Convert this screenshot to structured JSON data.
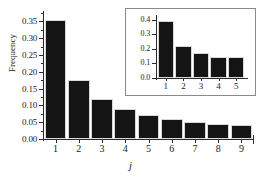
{
  "chart_data": [
    {
      "id": "main",
      "type": "bar",
      "title": "",
      "xlabel": "j",
      "ylabel": "Frequency",
      "categories": [
        "1",
        "2",
        "3",
        "4",
        "5",
        "6",
        "7",
        "8",
        "9"
      ],
      "values": [
        0.354,
        0.177,
        0.12,
        0.09,
        0.072,
        0.06,
        0.052,
        0.046,
        0.041
      ],
      "xlim": [
        0.5,
        9.5
      ],
      "ylim": [
        0.0,
        0.375
      ],
      "ytick_labels": [
        "0.00",
        "0.05",
        "0.10",
        "0.15",
        "0.20",
        "0.25",
        "0.30",
        "0.35"
      ],
      "ytick_values": [
        0.0,
        0.05,
        0.1,
        0.15,
        0.2,
        0.25,
        0.3,
        0.35
      ],
      "grid": false,
      "legend": "none",
      "bar_color": "#141414",
      "axis_color": "#2b2b2b"
    },
    {
      "id": "inset",
      "type": "bar",
      "title": "",
      "xlabel": "",
      "ylabel": "",
      "categories": [
        "1",
        "2",
        "3",
        "4",
        "5"
      ],
      "values": [
        0.395,
        0.222,
        0.17,
        0.147,
        0.142
      ],
      "xlim": [
        0.5,
        5.5
      ],
      "ylim": [
        0.0,
        0.42
      ],
      "ytick_labels": [
        "0.0",
        "0.1",
        "0.2",
        "0.3",
        "0.4"
      ],
      "ytick_values": [
        0.0,
        0.1,
        0.2,
        0.3,
        0.4
      ],
      "grid": false,
      "legend": "none",
      "bar_color": "#141414",
      "axis_color": "#2b2b2b",
      "frame_color": "#8a8a8a"
    }
  ],
  "figure": {
    "background": "#ffffff",
    "main_axis_title_x": "j",
    "main_axis_title_y": "Frequency"
  }
}
